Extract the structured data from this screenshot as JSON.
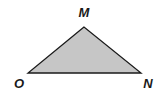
{
  "diagram": {
    "type": "triangle",
    "fill_color": "#c6c6c6",
    "stroke_color": "#1a1a1a",
    "vertices": [
      {
        "name": "M",
        "x": 84,
        "y": 27,
        "label_x": 84,
        "label_y": 17
      },
      {
        "name": "O",
        "x": 28,
        "y": 73,
        "label_x": 19,
        "label_y": 88
      },
      {
        "name": "N",
        "x": 141,
        "y": 73,
        "label_x": 148,
        "label_y": 88
      }
    ]
  }
}
